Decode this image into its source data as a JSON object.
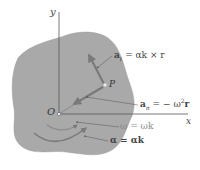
{
  "figure": {
    "colors": {
      "body_fill": "#a9a9a9",
      "body_edge": "#9a9a9a",
      "axis": "#555555",
      "vector": "#7a7a7a",
      "leader": "#666666",
      "text": "#444444",
      "omega_text": "#8a8a8a"
    },
    "axes": {
      "y_label": "y",
      "x_label": "x",
      "origin_label": "O"
    },
    "point": {
      "label": "P"
    },
    "labels": {
      "a_t": {
        "lhs": "a",
        "sub": "t",
        "rhs": " = αk × r"
      },
      "a_n": {
        "lhs": "a",
        "sub": "n",
        "rhs_pre": " = − ω",
        "sup": "2",
        "rhs_post": "r"
      },
      "omega": "ω = ωk",
      "alpha": "α = αk"
    }
  }
}
